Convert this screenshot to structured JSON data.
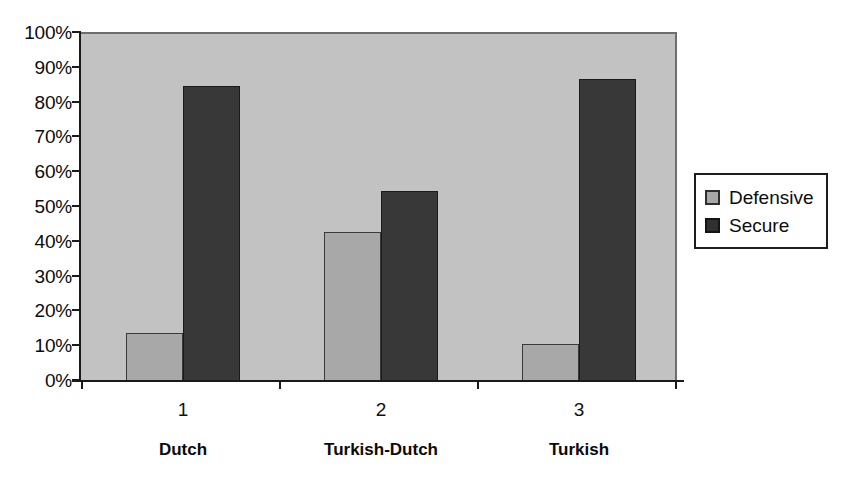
{
  "chart_data": {
    "type": "bar",
    "title": "",
    "subtitle": "",
    "xlabel": "",
    "ylabel": "",
    "categories": [
      "1",
      "2",
      "3"
    ],
    "category_names": [
      "Dutch",
      "Turkish-Dutch",
      "Turkish"
    ],
    "series": [
      {
        "name": "Defensive",
        "color": "#a8a8a8",
        "values": [
          14,
          43,
          11
        ]
      },
      {
        "name": "Secure",
        "color": "#383838",
        "values": [
          85,
          55,
          87
        ]
      }
    ],
    "ylim": [
      0,
      100
    ],
    "y_ticks": [
      0,
      10,
      20,
      30,
      40,
      50,
      60,
      70,
      80,
      90,
      100
    ],
    "y_tick_labels": [
      "0%",
      "10%",
      "20%",
      "30%",
      "40%",
      "50%",
      "60%",
      "70%",
      "80%",
      "90%",
      "100%"
    ],
    "grid": false,
    "legend_position": "right",
    "plot_background": "#c2c2c2",
    "axis_color": "#1a1a1a"
  },
  "legend": {
    "items": [
      {
        "label": "Defensive",
        "color": "#a8a8a8"
      },
      {
        "label": "Secure",
        "color": "#383838"
      }
    ]
  }
}
